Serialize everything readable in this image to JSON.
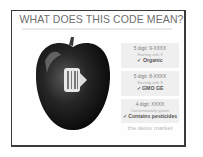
{
  "title": "WHAT DOES THIS CODE MEAN?",
  "boxes": [
    {
      "code": "5 digit: 9-XXXX",
      "desc": "Starting with 9",
      "result": "✓ Organic"
    },
    {
      "code": "5 digit: 8-XXXX",
      "desc": "Starting with 8",
      "result": "✓ GMO GE"
    },
    {
      "code": "4 digit: XXXX",
      "desc": "Conventionally grown",
      "result": "✓ Contains pesticides"
    }
  ],
  "brand": "the detox market",
  "image": {
    "subject": "apple-with-plu-sticker",
    "sticker_icon": "barcode-icon"
  }
}
